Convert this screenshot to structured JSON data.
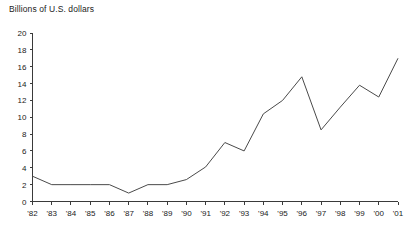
{
  "chart_data": {
    "type": "line",
    "title": "Billions of U.S. dollars",
    "xlabel": "",
    "ylabel": "",
    "ylim": [
      0,
      20
    ],
    "ytick_step": 2,
    "yticks": [
      0,
      2,
      4,
      6,
      8,
      10,
      12,
      14,
      16,
      18,
      20
    ],
    "ytick_labels": [
      "0",
      "2",
      "4",
      "6",
      "8",
      "10",
      "12",
      "14",
      "16",
      "18",
      "20"
    ],
    "categories": [
      "'82",
      "'83",
      "'84",
      "'85",
      "'86",
      "'87",
      "'88",
      "'89",
      "'90",
      "'91",
      "'92",
      "'93",
      "'94",
      "'95",
      "'96",
      "'97",
      "'98",
      "'99",
      "'00",
      "'01"
    ],
    "values": [
      3,
      2,
      2,
      2,
      2,
      1,
      2,
      2,
      2.6,
      4.1,
      7,
      6,
      10.4,
      12,
      14.8,
      8.5,
      11.2,
      13.8,
      12.4,
      17
    ],
    "grid": false,
    "legend": false,
    "line_color": "#4a4a4a",
    "axis_color": "#3a3a3a",
    "background": "#ffffff"
  }
}
